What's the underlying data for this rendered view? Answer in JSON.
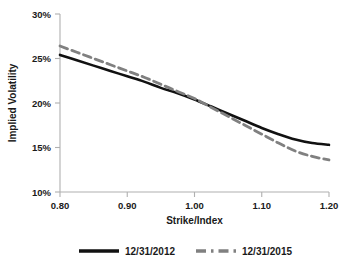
{
  "chart_data": {
    "type": "line",
    "title": "",
    "xlabel": "Strike/Index",
    "ylabel": "Implied Volatility",
    "xlim": [
      0.8,
      1.2
    ],
    "ylim": [
      0.1,
      0.3
    ],
    "grid": false,
    "legend_position": "bottom",
    "xticks": [
      "0.80",
      "0.90",
      "1.00",
      "1.10",
      "1.20"
    ],
    "xtick_values": [
      0.8,
      0.9,
      1.0,
      1.1,
      1.2
    ],
    "yticks": [
      "10%",
      "15%",
      "20%",
      "25%",
      "30%"
    ],
    "ytick_values": [
      0.1,
      0.15,
      0.2,
      0.25,
      0.3
    ],
    "x": [
      0.8,
      0.825,
      0.85,
      0.875,
      0.9,
      0.925,
      0.95,
      0.975,
      1.0,
      1.025,
      1.05,
      1.075,
      1.1,
      1.125,
      1.15,
      1.175,
      1.2
    ],
    "series": [
      {
        "name": "12/31/2012",
        "style": "solid",
        "color": "#111111",
        "width": 2.6,
        "values": [
          0.254,
          0.248,
          0.242,
          0.236,
          0.23,
          0.224,
          0.217,
          0.211,
          0.204,
          0.196,
          0.188,
          0.18,
          0.172,
          0.165,
          0.159,
          0.155,
          0.153
        ]
      },
      {
        "name": "12/31/2015",
        "style": "dashed",
        "color": "#808080",
        "width": 2.8,
        "values": [
          0.264,
          0.257,
          0.25,
          0.243,
          0.236,
          0.229,
          0.221,
          0.213,
          0.205,
          0.195,
          0.185,
          0.175,
          0.165,
          0.155,
          0.146,
          0.14,
          0.136
        ]
      }
    ],
    "colors": {
      "series_1": "#111111",
      "series_2": "#808080",
      "axis": "#b0b0b0",
      "text": "#1a1a1a",
      "background": "#ffffff"
    }
  },
  "legend": {
    "entries": [
      {
        "label": "12/31/2012",
        "style": "solid",
        "color": "#111111"
      },
      {
        "label": "12/31/2015",
        "style": "dashed",
        "color": "#808080"
      }
    ]
  },
  "axes": {
    "x_title": "Strike/Index",
    "y_title": "Implied Volatility"
  }
}
